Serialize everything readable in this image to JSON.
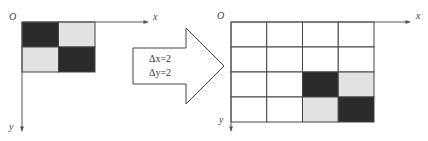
{
  "colors": {
    "dark": "#2b2b2b",
    "light": "#e2e2e2",
    "white": "#ffffff",
    "line": "#444444",
    "axis": "#555555"
  },
  "left_figure": {
    "origin_label": "O",
    "x_label": "x",
    "y_label": "y",
    "grid": {
      "cols": 2,
      "rows": 2
    },
    "cells": [
      [
        "dark",
        "light"
      ],
      [
        "light",
        "dark"
      ]
    ]
  },
  "arrow": {
    "line1": "Δx=2",
    "line2": "Δy=2"
  },
  "right_figure": {
    "origin_label": "O",
    "x_label": "x",
    "y_label": "y",
    "grid": {
      "cols": 4,
      "rows": 4
    },
    "cells": [
      [
        "white",
        "white",
        "white",
        "white"
      ],
      [
        "white",
        "white",
        "white",
        "white"
      ],
      [
        "white",
        "white",
        "dark",
        "light"
      ],
      [
        "white",
        "white",
        "light",
        "dark"
      ]
    ]
  }
}
